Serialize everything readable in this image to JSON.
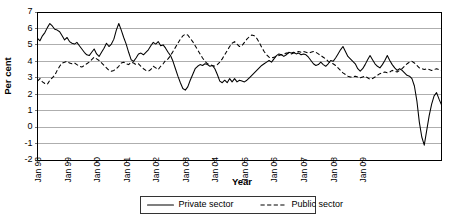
{
  "chart_data": {
    "type": "line",
    "title": "",
    "xlabel": "Year",
    "ylabel": "Per cent",
    "ylim": [
      -2,
      7
    ],
    "ytick_labels": [
      "7",
      "6",
      "5",
      "4",
      "3",
      "2",
      "1",
      "0",
      "-1",
      "-2"
    ],
    "ytick_values": [
      7,
      6,
      5,
      4,
      3,
      2,
      1,
      0,
      -1,
      -2
    ],
    "grid": true,
    "legend_position": "bottom",
    "x_start": "Jan 98",
    "x_end": "Jul 09",
    "x_frequency": "monthly",
    "xtick_labels": [
      "Jan 98",
      "Jan 99",
      "Jan 00",
      "Jan 01",
      "Jan 02",
      "Jan 03",
      "Jan 04",
      "Jan 05",
      "Jan 06",
      "Jan 07",
      "Jan 08",
      "Jan 09"
    ],
    "xtick_indices": [
      0,
      12,
      24,
      36,
      48,
      60,
      72,
      84,
      96,
      108,
      120,
      132
    ],
    "series": [
      {
        "name": "Private sector",
        "style": "solid",
        "color": "#000000",
        "values": [
          5.4,
          5.25,
          5.55,
          5.75,
          6.05,
          6.3,
          6.15,
          5.95,
          5.9,
          5.8,
          5.55,
          5.3,
          5.45,
          5.2,
          5.1,
          5.05,
          5.15,
          4.95,
          4.75,
          4.55,
          4.4,
          4.35,
          4.55,
          4.75,
          4.45,
          4.3,
          4.55,
          4.8,
          5.1,
          4.9,
          5.05,
          5.35,
          5.9,
          6.3,
          5.9,
          5.45,
          5.05,
          4.55,
          4.1,
          4.0,
          4.2,
          4.45,
          4.5,
          4.4,
          4.55,
          4.7,
          4.95,
          5.15,
          5.05,
          5.2,
          4.95,
          5.0,
          4.8,
          4.55,
          4.35,
          4.0,
          3.55,
          3.1,
          2.7,
          2.35,
          2.25,
          2.45,
          2.85,
          3.2,
          3.55,
          3.7,
          3.8,
          3.75,
          3.85,
          3.8,
          3.7,
          3.75,
          3.55,
          3.2,
          2.8,
          2.7,
          2.85,
          2.7,
          2.95,
          2.75,
          2.95,
          2.75,
          2.85,
          2.8,
          2.75,
          2.85,
          3.0,
          3.15,
          3.3,
          3.45,
          3.6,
          3.75,
          3.85,
          3.95,
          4.05,
          3.95,
          4.15,
          4.35,
          4.45,
          4.4,
          4.3,
          4.4,
          4.55,
          4.5,
          4.55,
          4.45,
          4.5,
          4.4,
          4.45,
          4.4,
          4.25,
          4.05,
          3.85,
          3.75,
          3.8,
          3.95,
          3.8,
          3.7,
          3.85,
          4.05,
          4.0,
          4.2,
          4.45,
          4.7,
          4.9,
          4.6,
          4.3,
          4.15,
          4.0,
          3.85,
          3.55,
          3.4,
          3.55,
          3.8,
          4.1,
          4.35,
          4.1,
          3.85,
          3.7,
          3.6,
          3.8,
          4.05,
          4.35,
          4.05,
          3.8,
          3.6,
          3.45,
          3.55,
          3.45,
          3.3,
          3.15,
          3.1,
          2.95,
          2.5,
          1.6,
          0.3,
          -0.6,
          -1.1,
          -0.2,
          0.7,
          1.4,
          1.9,
          2.1,
          1.7,
          1.35
        ]
      },
      {
        "name": "Public sector",
        "style": "dashed",
        "color": "#000000",
        "values": [
          2.8,
          2.95,
          2.75,
          2.65,
          2.6,
          2.85,
          3.0,
          3.15,
          3.45,
          3.7,
          3.9,
          3.95,
          4.0,
          3.9,
          3.85,
          3.9,
          3.8,
          3.7,
          3.65,
          3.75,
          3.85,
          3.95,
          4.1,
          4.25,
          4.15,
          4.05,
          3.9,
          3.75,
          3.6,
          3.45,
          3.4,
          3.45,
          3.55,
          3.7,
          3.9,
          3.95,
          3.85,
          3.8,
          3.95,
          3.9,
          3.8,
          3.85,
          3.7,
          3.55,
          3.45,
          3.4,
          3.5,
          3.7,
          3.6,
          3.5,
          3.7,
          3.85,
          4.05,
          4.15,
          4.35,
          4.6,
          4.85,
          5.1,
          5.35,
          5.55,
          5.65,
          5.6,
          5.4,
          5.2,
          4.95,
          4.7,
          4.45,
          4.2,
          4.0,
          3.85,
          3.8,
          3.75,
          3.7,
          3.8,
          3.95,
          4.15,
          4.4,
          4.65,
          4.9,
          5.1,
          5.2,
          5.05,
          4.9,
          4.95,
          5.15,
          5.35,
          5.5,
          5.6,
          5.55,
          5.4,
          5.15,
          4.85,
          4.6,
          4.4,
          4.25,
          4.2,
          4.25,
          4.3,
          4.35,
          4.4,
          4.45,
          4.5,
          4.5,
          4.45,
          4.5,
          4.55,
          4.6,
          4.55,
          4.6,
          4.55,
          4.5,
          4.55,
          4.6,
          4.55,
          4.45,
          4.35,
          4.25,
          4.15,
          4.0,
          3.9,
          3.85,
          3.75,
          3.6,
          3.45,
          3.3,
          3.2,
          3.1,
          3.05,
          3.05,
          3.1,
          3.05,
          3.0,
          3.05,
          3.1,
          3.0,
          2.9,
          2.95,
          3.05,
          3.15,
          3.25,
          3.3,
          3.35,
          3.3,
          3.35,
          3.45,
          3.4,
          3.35,
          3.45,
          3.55,
          3.7,
          3.85,
          3.95,
          4.0,
          3.9,
          3.75,
          3.6,
          3.55,
          3.5,
          3.55,
          3.5,
          3.45,
          3.5,
          3.55,
          3.5,
          3.45
        ]
      }
    ]
  },
  "legend": {
    "items": [
      {
        "label": "Private sector",
        "style": "solid"
      },
      {
        "label": "Public sector",
        "style": "dashed"
      }
    ]
  }
}
